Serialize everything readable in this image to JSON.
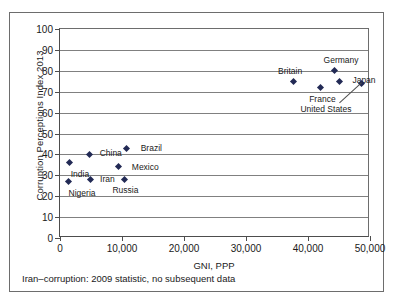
{
  "figure": {
    "footnote": "Iran–corruption: 2009 statistic, no subsequent data"
  },
  "chart_data": {
    "type": "scatter",
    "title": "",
    "xlabel": "GNI, PPP",
    "ylabel": "Corruption Perceptions Index 2013",
    "xlim": [
      0,
      50000
    ],
    "ylim": [
      0,
      100
    ],
    "grid": true,
    "legend": "none",
    "xticks": [
      0,
      10000,
      20000,
      30000,
      40000,
      50000
    ],
    "xtick_labels": [
      "0",
      "10,000",
      "20,000",
      "30,000",
      "40,000",
      "50,000"
    ],
    "yticks": [
      0,
      10,
      20,
      30,
      40,
      50,
      60,
      70,
      80,
      90,
      100
    ],
    "ytick_labels": [
      "0",
      "10",
      "20",
      "30",
      "40",
      "50",
      "60",
      "70",
      "80",
      "90",
      "100"
    ],
    "marker": "diamond",
    "marker_color": "#222a55",
    "points": [
      {
        "label": "Nigeria",
        "x": 1300,
        "y": 27,
        "label_dx": 14,
        "label_dy": 11
      },
      {
        "label": "India",
        "x": 1600,
        "y": 36,
        "label_dx": 10,
        "label_dy": 11
      },
      {
        "label": "China",
        "x": 4800,
        "y": 40,
        "label_dx": 21,
        "label_dy": -1
      },
      {
        "label": "Iran",
        "x": 4900,
        "y": 28,
        "label_dx": 17,
        "label_dy": 0
      },
      {
        "label": "Russia",
        "x": 10400,
        "y": 28,
        "label_dx": 1,
        "label_dy": 11
      },
      {
        "label": "Brazil",
        "x": 10700,
        "y": 43,
        "label_dx": 25,
        "label_dy": 0
      },
      {
        "label": "Mexico",
        "x": 9400,
        "y": 34,
        "label_dx": 27,
        "label_dy": 0
      },
      {
        "label": "Britain",
        "x": 37600,
        "y": 75,
        "label_dx": -3,
        "label_dy": -10
      },
      {
        "label": "France",
        "x": 42000,
        "y": 72,
        "label_dx": 2,
        "label_dy": 11
      },
      {
        "label": "Germany",
        "x": 44200,
        "y": 80,
        "label_dx": 7,
        "label_dy": -11
      },
      {
        "label": "Japan",
        "x": 45000,
        "y": 75,
        "label_dx": 25,
        "label_dy": -1
      },
      {
        "label": "United States",
        "x": 48700,
        "y": 74,
        "label_dx": -36,
        "label_dy": 26,
        "leader": true
      }
    ]
  }
}
